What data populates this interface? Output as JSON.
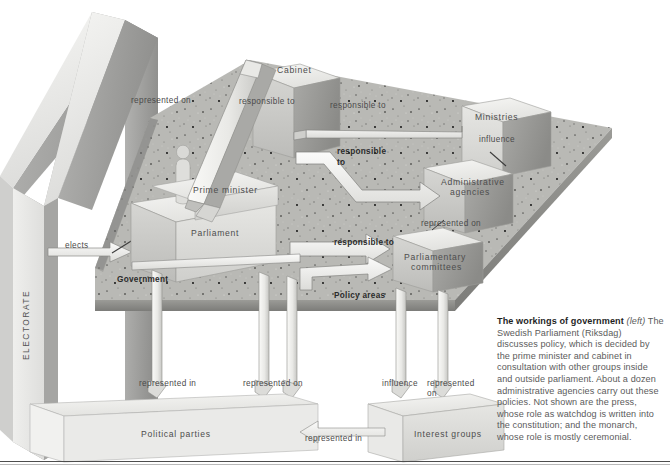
{
  "diagram": {
    "title_hidden": "The workings of government",
    "electorate_label": "ELECTORATE",
    "boxes": {
      "cabinet": "Cabinet",
      "ministries": "Ministries",
      "prime_minister": "Prime minister",
      "parliament": "Parliament",
      "administrative_agencies_line1": "Administrative",
      "administrative_agencies_line2": "agencies",
      "parliamentary_committees_line1": "Parliamentary",
      "parliamentary_committees_line2": "committees",
      "political_parties": "Political parties",
      "interest_groups": "Interest groups"
    },
    "connectors": {
      "elects": "elects",
      "represented_on_cabinet": "represented  on",
      "responsible_to_cabinet": "responsible  to",
      "responsible_to_ministries": "responsible  to",
      "responsible_to_bold_1_line1": "responsible",
      "responsible_to_bold_1_line2": "to",
      "responsible_to_bold_2": "responsible to",
      "government": "Government",
      "policy_areas": "Policy  areas",
      "influence_ministries": "influence",
      "represented_on_agencies": "represented  on",
      "represented_in_parties": "represented in",
      "represented_on_parties": "represented on",
      "influence_interest": "influence",
      "represented_on_interest_line1": "represented",
      "represented_on_interest_line2": "on",
      "represented_in_interest": "represented in"
    }
  },
  "caption": {
    "heading": "The workings of government",
    "heading_suffix": "(left)",
    "body": "The Swedish Parliament (Riksdag) discusses policy, which is decided by the prime minister and cabinet in consultation with other groups inside and outside parliament. About a dozen administrative agencies carry out these policies. Not shown are the press, whose role as watchdog is written into the constitution; and the monarch, whose role is mostly ceremonial."
  },
  "colors": {
    "page_background": "#ffffff",
    "box_top": "#f0f0ee",
    "box_front": "#c9c9c7",
    "box_side": "#9a9a98",
    "plate_top": "#b8b8b4",
    "plate_edge": "#8d8d8a",
    "wall_front": "#e4e4e2",
    "wall_side": "#a8a8a6",
    "arrow_fill": "#f4f4f2",
    "arrow_edge": "#7d7d7b",
    "text": "#4a4a4a",
    "text_bold": "#2b2b2b",
    "rule": "#4d4d4d"
  }
}
